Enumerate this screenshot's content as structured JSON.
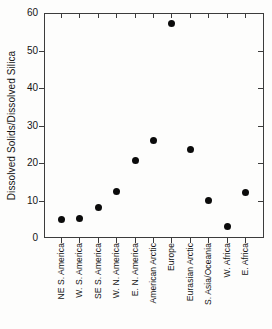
{
  "figure": {
    "background": "#fdfdfc"
  },
  "colors": {
    "axis": "#3c3c3c",
    "text": "#151515",
    "marker": "#0b0b0b"
  },
  "chart_data": {
    "type": "scatter",
    "title": "",
    "xlabel": "",
    "ylabel": "Dissolved Solids/Dissolved Silica",
    "ylim": [
      0,
      60
    ],
    "yticks": [
      0,
      10,
      20,
      30,
      40,
      50,
      60
    ],
    "grid": false,
    "legend": false,
    "marker": "filled-circle",
    "tick_style": "left-bottom-outward, top-right-inward",
    "categories": [
      "NE S. America",
      "W. S. America",
      "SE S. America",
      "W. N. America",
      "E. N. America",
      "American Arctic",
      "Europe",
      "Eurasian Arctic",
      "S. Asia/Oceania",
      "W. Africa",
      "E. Africa"
    ],
    "values": [
      5.0,
      5.2,
      8.2,
      12.3,
      20.6,
      26.0,
      57.2,
      23.5,
      10.0,
      3.0,
      12.2
    ]
  }
}
